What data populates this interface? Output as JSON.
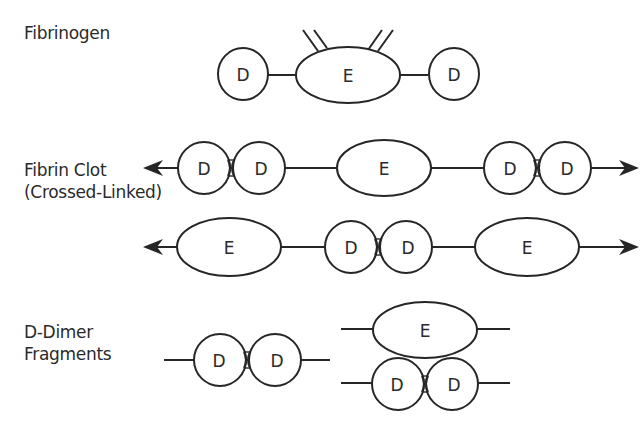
{
  "diagram": {
    "type": "molecular-schematic",
    "colors": {
      "stroke": "#262626",
      "text": "#2a2a2a",
      "background": "#ffffff"
    },
    "rows": [
      {
        "id": "fibrinogen",
        "label_lines": [
          "Fibrinogen"
        ],
        "nodes": [
          {
            "kind": "domain",
            "label": "D"
          },
          {
            "kind": "domain",
            "label": "E"
          },
          {
            "kind": "domain",
            "label": "D"
          }
        ],
        "features": [
          "fibrinopeptide double lines on E domain"
        ]
      },
      {
        "id": "fibrin-clot-strand-1",
        "label_lines": [
          "Fibrin Clot",
          "(Crossed-Linked)"
        ],
        "nodes": [
          {
            "kind": "domain",
            "label": "D"
          },
          {
            "kind": "domain",
            "label": "D"
          },
          {
            "kind": "domain",
            "label": "E"
          },
          {
            "kind": "domain",
            "label": "D"
          },
          {
            "kind": "domain",
            "label": "D"
          }
        ],
        "features": [
          "arrows on both ends",
          "cross-links between D-D pairs"
        ]
      },
      {
        "id": "fibrin-clot-strand-2",
        "label_lines": [],
        "nodes": [
          {
            "kind": "domain",
            "label": "E"
          },
          {
            "kind": "domain",
            "label": "D"
          },
          {
            "kind": "domain",
            "label": "D"
          },
          {
            "kind": "domain",
            "label": "E"
          }
        ],
        "features": [
          "arrows on both ends",
          "cross-link between D-D pair"
        ]
      },
      {
        "id": "d-dimer-fragments",
        "label_lines": [
          "D-Dimer",
          "Fragments"
        ],
        "nodes": [
          {
            "kind": "domain",
            "label": "D"
          },
          {
            "kind": "domain",
            "label": "D"
          },
          {
            "kind": "domain",
            "label": "E"
          },
          {
            "kind": "domain",
            "label": "D"
          },
          {
            "kind": "domain",
            "label": "D"
          }
        ],
        "features": [
          "free D-dimer",
          "E domain complexed with D-dimer"
        ]
      }
    ],
    "node_labels": {
      "d": "D",
      "e": "E"
    }
  }
}
